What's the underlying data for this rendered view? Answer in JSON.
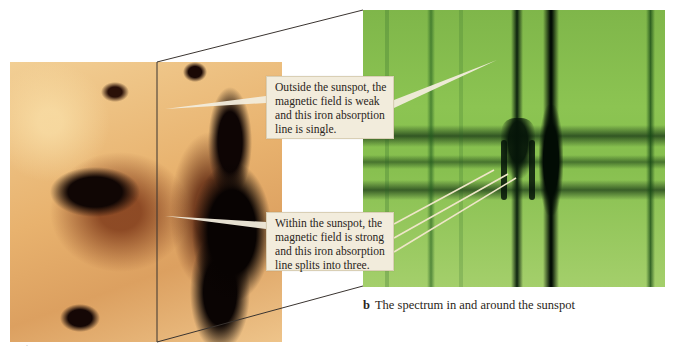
{
  "figure": {
    "panel_a": {
      "label": "a",
      "description": "sunspot-image"
    },
    "panel_b": {
      "label": "b",
      "caption": "The spectrum in and around the sunspot"
    },
    "callouts": [
      {
        "id": "outside",
        "lines": [
          "Outside the sunspot, the",
          "magnetic field is weak",
          "and this iron absorption",
          "line is single."
        ]
      },
      {
        "id": "within",
        "lines": [
          "Within the sunspot, the",
          "magnetic field is strong",
          "and this iron absorption",
          "line splits into three."
        ]
      }
    ],
    "colors": {
      "callout_bg": "#f2ecdc",
      "spectrum_green": "#86bf4e",
      "sunspot_orange": "#e8b26e",
      "frame_line": "#3a3430"
    }
  }
}
